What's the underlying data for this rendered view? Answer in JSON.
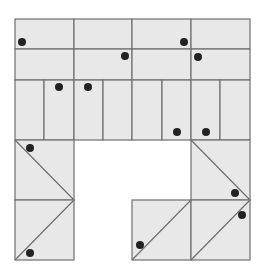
{
  "diagram": {
    "width": 262,
    "height": 273,
    "colors": {
      "fill": "#e8e8e8",
      "stroke": "#6f6f6f",
      "dot": "#222222",
      "background": "#ffffff"
    },
    "cells": [
      {
        "x": 15,
        "y": 19,
        "w": 59,
        "h": 30
      },
      {
        "x": 74,
        "y": 19,
        "w": 58,
        "h": 30
      },
      {
        "x": 132,
        "y": 19,
        "w": 59,
        "h": 30
      },
      {
        "x": 191,
        "y": 19,
        "w": 59,
        "h": 30
      },
      {
        "x": 15,
        "y": 49,
        "w": 59,
        "h": 31
      },
      {
        "x": 74,
        "y": 49,
        "w": 58,
        "h": 31
      },
      {
        "x": 132,
        "y": 49,
        "w": 59,
        "h": 31
      },
      {
        "x": 191,
        "y": 49,
        "w": 59,
        "h": 31
      },
      {
        "x": 15,
        "y": 80,
        "w": 29,
        "h": 60
      },
      {
        "x": 44,
        "y": 80,
        "w": 30,
        "h": 60
      },
      {
        "x": 74,
        "y": 80,
        "w": 29,
        "h": 60
      },
      {
        "x": 103,
        "y": 80,
        "w": 29,
        "h": 60
      },
      {
        "x": 132,
        "y": 80,
        "w": 30,
        "h": 60
      },
      {
        "x": 162,
        "y": 80,
        "w": 29,
        "h": 60
      },
      {
        "x": 191,
        "y": 80,
        "w": 29,
        "h": 60
      },
      {
        "x": 220,
        "y": 80,
        "w": 30,
        "h": 60
      },
      {
        "x": 15,
        "y": 140,
        "w": 59,
        "h": 60
      },
      {
        "x": 15,
        "y": 200,
        "w": 59,
        "h": 60
      },
      {
        "x": 191,
        "y": 140,
        "w": 59,
        "h": 60
      },
      {
        "x": 132,
        "y": 200,
        "w": 59,
        "h": 60
      },
      {
        "x": 191,
        "y": 200,
        "w": 59,
        "h": 60
      }
    ],
    "diagonals": [
      {
        "x1": 15,
        "y1": 140,
        "x2": 74,
        "y2": 200
      },
      {
        "x1": 74,
        "y1": 200,
        "x2": 15,
        "y2": 260
      },
      {
        "x1": 191,
        "y1": 140,
        "x2": 250,
        "y2": 200
      },
      {
        "x1": 132,
        "y1": 260,
        "x2": 191,
        "y2": 200
      },
      {
        "x1": 191,
        "y1": 260,
        "x2": 250,
        "y2": 200
      }
    ],
    "dots": [
      {
        "x": 22,
        "y": 42
      },
      {
        "x": 125,
        "y": 56
      },
      {
        "x": 184,
        "y": 42
      },
      {
        "x": 198,
        "y": 57
      },
      {
        "x": 59,
        "y": 87
      },
      {
        "x": 88,
        "y": 87
      },
      {
        "x": 177,
        "y": 132
      },
      {
        "x": 206,
        "y": 132
      },
      {
        "x": 30,
        "y": 148
      },
      {
        "x": 30,
        "y": 253
      },
      {
        "x": 235,
        "y": 193
      },
      {
        "x": 242,
        "y": 215
      },
      {
        "x": 140,
        "y": 245
      }
    ],
    "dot_radius": 4
  }
}
